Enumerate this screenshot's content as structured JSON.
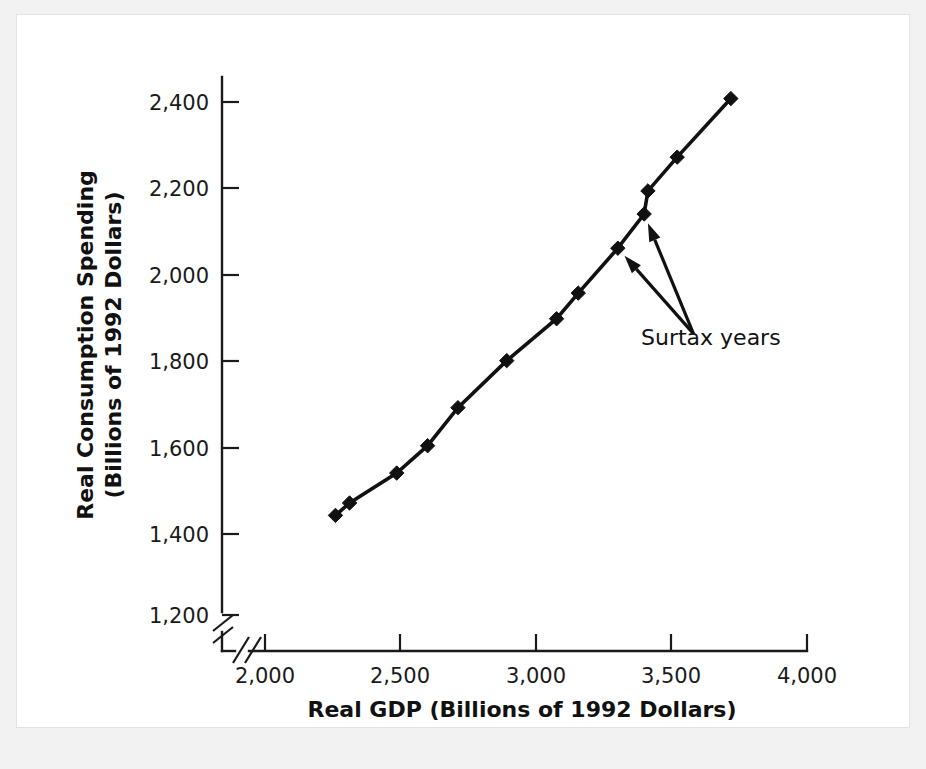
{
  "chart_data": {
    "type": "line",
    "title": "",
    "xlabel": "Real GDP (Billions of 1992 Dollars)",
    "ylabel": "Real Consumption Spending (Billions of 1992 Dollars)",
    "ylabel_line1": "Real Consumption Spending",
    "ylabel_line2": "(Billions of 1992 Dollars)",
    "xlim": [
      1900,
      4000
    ],
    "ylim": [
      1150,
      2480
    ],
    "x_axis_break": true,
    "y_axis_break": true,
    "grid": false,
    "legend": "none",
    "xticks": [
      2000,
      2500,
      3000,
      3500,
      4000
    ],
    "xtick_labels": [
      "2,000",
      "2,500",
      "3,000",
      "3,500",
      "4,000"
    ],
    "yticks": [
      1200,
      1400,
      1600,
      1800,
      2000,
      2200,
      2400
    ],
    "ytick_labels": [
      "1,200",
      "1,400",
      "1,600",
      "1,800",
      "2,000",
      "2,200",
      "2,400"
    ],
    "x": [
      2260,
      2312,
      2486,
      2600,
      2712,
      2892,
      3076,
      3156,
      3302,
      3399,
      3413,
      3521,
      3719
    ],
    "y": [
      1433,
      1462,
      1532,
      1596,
      1685,
      1795,
      1893,
      1953,
      2058,
      2138,
      2192,
      2271,
      2408
    ],
    "marker": "diamond",
    "marker_color": "#111111",
    "line_color": "#111111",
    "annotations": [
      {
        "label": "Surtax years",
        "text_x": 3640,
        "text_y": 1877,
        "targets": [
          {
            "x": 3302,
            "y": 2058
          },
          {
            "x": 3399,
            "y": 2138
          }
        ]
      }
    ]
  },
  "figure": {
    "background_color": "#f2f2f2",
    "plate_color": "#ffffff",
    "ink_color": "#111111"
  }
}
